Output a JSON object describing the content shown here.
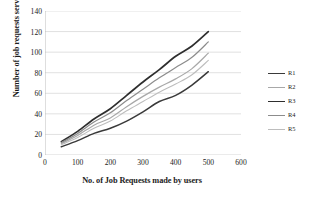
{
  "chart_data": {
    "type": "line",
    "title": "",
    "xlabel": "No. of Job Requests made by users",
    "ylabel": "Number of job requests served",
    "xlim": [
      0,
      600
    ],
    "ylim": [
      0,
      140
    ],
    "xticks": [
      0,
      100,
      200,
      300,
      400,
      500,
      600
    ],
    "yticks": [
      0,
      20,
      40,
      60,
      80,
      100,
      120,
      140
    ],
    "grid": "horizontal",
    "legend_position": "right",
    "x": [
      50,
      100,
      150,
      200,
      250,
      300,
      350,
      400,
      450,
      500
    ],
    "series": [
      {
        "name": "R1",
        "color": "#3a3a3a",
        "width": 1.5,
        "values": [
          8,
          14,
          21,
          26,
          33,
          42,
          52,
          58,
          68,
          81
        ]
      },
      {
        "name": "R2",
        "color": "#a8a8a8",
        "width": 1.2,
        "values": [
          11,
          19,
          29,
          36,
          47,
          57,
          66,
          74,
          84,
          99
        ]
      },
      {
        "name": "R3",
        "color": "#2e2e2e",
        "width": 1.7,
        "values": [
          13,
          23,
          35,
          45,
          58,
          71,
          83,
          96,
          106,
          120
        ]
      },
      {
        "name": "R4",
        "color": "#8c8c8c",
        "width": 1.2,
        "values": [
          12,
          21,
          32,
          41,
          53,
          64,
          75,
          85,
          95,
          110
        ]
      },
      {
        "name": "R5",
        "color": "#bdbdbd",
        "width": 1.1,
        "values": [
          10,
          17,
          26,
          33,
          43,
          52,
          61,
          69,
          78,
          92
        ]
      }
    ]
  },
  "legend": {
    "entries": [
      {
        "label": "R1"
      },
      {
        "label": "R2"
      },
      {
        "label": "R3"
      },
      {
        "label": "R4"
      },
      {
        "label": "R5"
      }
    ]
  }
}
